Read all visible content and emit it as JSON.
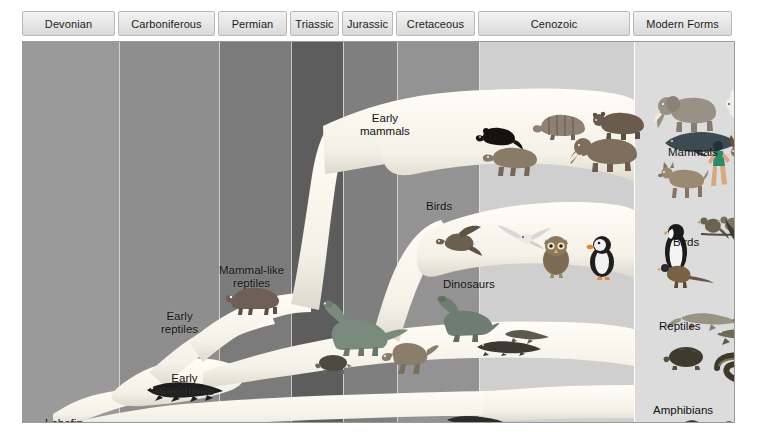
{
  "figure": {
    "geologic_periods": [
      {
        "label": "Devonian",
        "x": 0,
        "w": 96,
        "shade": "#9a9a9a"
      },
      {
        "label": "Carboniferous",
        "x": 96,
        "w": 100,
        "shade": "#8e8e8e"
      },
      {
        "label": "Permian",
        "x": 196,
        "w": 72,
        "shade": "#7b7b7b"
      },
      {
        "label": "Triassic",
        "x": 268,
        "w": 52,
        "shade": "#5d5d5d"
      },
      {
        "label": "Jurassic",
        "x": 320,
        "w": 54,
        "shade": "#7f7f7f"
      },
      {
        "label": "Cretaceous",
        "x": 374,
        "w": 82,
        "shade": "#939393"
      },
      {
        "label": "Cenozoic",
        "x": 456,
        "w": 155,
        "shade": "#cfcfcf"
      },
      {
        "label": "Modern Forms",
        "x": 611,
        "w": 102,
        "shade": "#dcdcdc"
      }
    ],
    "tree_labels": [
      {
        "id": "lobefin-fishes",
        "text": "Lobefin\nfishes",
        "x": 22,
        "y": 375
      },
      {
        "id": "early-amphibians",
        "text": "Early\namphibians",
        "x": 132,
        "y": 330
      },
      {
        "id": "early-reptiles",
        "text": "Early\nreptiles",
        "x": 138,
        "y": 268
      },
      {
        "id": "mammal-like-reptiles",
        "text": "Mammal-like\nreptiles",
        "x": 196,
        "y": 222
      },
      {
        "id": "early-mammals",
        "text": "Early\nmammals",
        "x": 337,
        "y": 70
      },
      {
        "id": "birds",
        "text": "Birds",
        "x": 403,
        "y": 158
      },
      {
        "id": "dinosaurs",
        "text": "Dinosaurs",
        "x": 420,
        "y": 236
      }
    ],
    "modern_groups": [
      {
        "id": "mammals",
        "label": "Mammals",
        "x": 668,
        "y": 146
      },
      {
        "id": "birds",
        "label": "Birds",
        "x": 673,
        "y": 236
      },
      {
        "id": "reptiles",
        "label": "Reptiles",
        "x": 659,
        "y": 320
      },
      {
        "id": "amphibians",
        "label": "Amphibians",
        "x": 653,
        "y": 404
      }
    ],
    "organisms": [
      {
        "id": "lobefin-fish",
        "group": "fishes",
        "x": 52,
        "y": 392
      },
      {
        "id": "early-amphibian",
        "group": "amphibians",
        "x": 126,
        "y": 363
      },
      {
        "id": "mammal-like-reptile",
        "group": "synapsids",
        "x": 206,
        "y": 252
      },
      {
        "id": "turtle",
        "group": "reptiles",
        "x": 300,
        "y": 318
      },
      {
        "id": "sauropod",
        "group": "dinosaurs",
        "x": 300,
        "y": 268
      },
      {
        "id": "small-dinosaur",
        "group": "dinosaurs",
        "x": 365,
        "y": 300
      },
      {
        "id": "long-neck-dino",
        "group": "dinosaurs",
        "x": 410,
        "y": 262
      },
      {
        "id": "crocodile",
        "group": "reptiles",
        "x": 455,
        "y": 300
      },
      {
        "id": "lizard",
        "group": "reptiles",
        "x": 480,
        "y": 290
      },
      {
        "id": "aquatic-salamander",
        "group": "amphibians",
        "x": 430,
        "y": 378
      },
      {
        "id": "archaeopteryx",
        "group": "birds",
        "x": 423,
        "y": 192
      },
      {
        "id": "seagull",
        "group": "birds",
        "x": 486,
        "y": 190
      },
      {
        "id": "owl",
        "group": "birds",
        "x": 520,
        "y": 205
      },
      {
        "id": "puffin",
        "group": "birds",
        "x": 568,
        "y": 205
      },
      {
        "id": "early-mammal-rat",
        "group": "mammals",
        "x": 460,
        "y": 92
      },
      {
        "id": "tapir",
        "group": "mammals",
        "x": 470,
        "y": 108
      },
      {
        "id": "armadillo",
        "group": "mammals",
        "x": 522,
        "y": 78
      },
      {
        "id": "bear",
        "group": "mammals",
        "x": 578,
        "y": 78
      },
      {
        "id": "mastodon",
        "group": "mammals",
        "x": 560,
        "y": 100
      },
      {
        "id": "elephant",
        "group": "mammals",
        "x": 648,
        "y": 60
      },
      {
        "id": "rabbit",
        "group": "mammals",
        "x": 712,
        "y": 56
      },
      {
        "id": "whale",
        "group": "mammals",
        "x": 660,
        "y": 95
      },
      {
        "id": "deer",
        "group": "mammals",
        "x": 718,
        "y": 105
      },
      {
        "id": "human",
        "group": "mammals",
        "x": 692,
        "y": 110
      },
      {
        "id": "wolf",
        "group": "mammals",
        "x": 652,
        "y": 128
      },
      {
        "id": "penguin",
        "group": "birds",
        "x": 650,
        "y": 192
      },
      {
        "id": "perched-birds",
        "group": "birds",
        "x": 688,
        "y": 180
      },
      {
        "id": "eagle",
        "group": "birds",
        "x": 715,
        "y": 195
      },
      {
        "id": "pheasant",
        "group": "birds",
        "x": 648,
        "y": 225
      },
      {
        "id": "salamander-modern",
        "group": "reptiles",
        "x": 660,
        "y": 275
      },
      {
        "id": "modern-lizard",
        "group": "reptiles",
        "x": 700,
        "y": 292
      },
      {
        "id": "tortoise",
        "group": "reptiles",
        "x": 652,
        "y": 310
      },
      {
        "id": "snake",
        "group": "reptiles",
        "x": 700,
        "y": 318
      },
      {
        "id": "newt",
        "group": "amphibians",
        "x": 655,
        "y": 388
      },
      {
        "id": "frog",
        "group": "amphibians",
        "x": 705,
        "y": 390
      }
    ],
    "colors": {
      "branch": "#f6f4ee",
      "frame_border": "#9a9a9a",
      "tab_text": "#1b1b1b",
      "label_text": "#111111",
      "modern_panel": "#dcdcdc",
      "page_background": "#ffffff"
    }
  }
}
